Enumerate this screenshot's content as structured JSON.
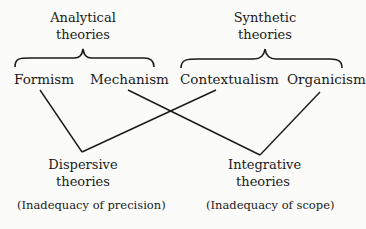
{
  "groups": {
    "analytical": {
      "line1": "Analytical",
      "line2": "theories"
    },
    "synthetic": {
      "line1": "Synthetic",
      "line2": "theories"
    }
  },
  "terms": {
    "formism": "Formism",
    "mechanism": "Mechanism",
    "contextualism": "Contextualism",
    "organicism": "Organicism"
  },
  "results": {
    "dispersive": {
      "line1": "Dispersive",
      "line2": "theories",
      "note": "(Inadequacy of precision)"
    },
    "integrative": {
      "line1": "Integrative",
      "line2": "theories",
      "note": "(Inadequacy of scope)"
    }
  },
  "connections": [
    {
      "from": "Formism",
      "to": "Dispersive theories"
    },
    {
      "from": "Contextualism",
      "to": "Dispersive theories"
    },
    {
      "from": "Mechanism",
      "to": "Integrative theories"
    },
    {
      "from": "Organicism",
      "to": "Integrative theories"
    }
  ]
}
